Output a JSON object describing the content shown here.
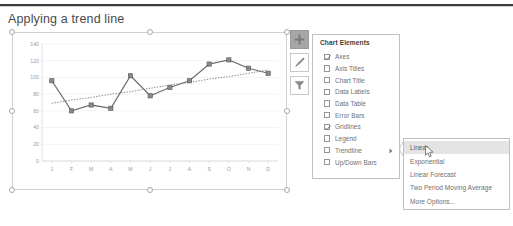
{
  "page": {
    "title": "Applying a trend line"
  },
  "chart_buttons": [
    {
      "name": "chart-elements-button",
      "icon": "plus-icon",
      "label": "Chart Elements",
      "active": true
    },
    {
      "name": "chart-styles-button",
      "icon": "brush-icon",
      "label": "Chart Styles",
      "active": false
    },
    {
      "name": "chart-filters-button",
      "icon": "funnel-icon",
      "label": "Chart Filters",
      "active": false
    }
  ],
  "chart_elements_panel": {
    "title": "Chart Elements",
    "items": [
      {
        "label": "Axes",
        "checked": true,
        "has_submenu": false
      },
      {
        "label": "Axis Titles",
        "checked": false,
        "has_submenu": false
      },
      {
        "label": "Chart Title",
        "checked": false,
        "has_submenu": false
      },
      {
        "label": "Data Labels",
        "checked": false,
        "has_submenu": false
      },
      {
        "label": "Data Table",
        "checked": false,
        "has_submenu": false
      },
      {
        "label": "Error Bars",
        "checked": false,
        "has_submenu": false
      },
      {
        "label": "Gridlines",
        "checked": true,
        "has_submenu": false
      },
      {
        "label": "Legend",
        "checked": false,
        "has_submenu": false
      },
      {
        "label": "Trendline",
        "checked": false,
        "has_submenu": true
      },
      {
        "label": "Up/Down Bars",
        "checked": false,
        "has_submenu": false
      }
    ]
  },
  "trendline_submenu": {
    "items": [
      {
        "label": "Linear",
        "highlighted": true
      },
      {
        "label": "Exponential",
        "highlighted": false
      },
      {
        "label": "Linear Forecast",
        "highlighted": false
      },
      {
        "label": "Two Period Moving Average",
        "highlighted": false
      },
      {
        "label": "More Options...",
        "highlighted": false
      }
    ]
  },
  "colors": {
    "rule": "#3d3d3d",
    "series": "#6f6f6f",
    "marker": "#8a8a8a",
    "trend": "#7a7a7a",
    "grid": "#ededed",
    "panel_border": "#c0c0c0",
    "highlight": "#e4e4e4",
    "active_button": "#a6a6a6",
    "tick_text": "#9b9b9b"
  },
  "chart_data": {
    "type": "line",
    "title": "",
    "xlabel": "",
    "ylabel": "",
    "grid": true,
    "legend": "none",
    "ylim": [
      0,
      140
    ],
    "yticks": [
      0,
      20,
      40,
      60,
      80,
      100,
      120,
      140
    ],
    "categories": [
      "J",
      "F",
      "M",
      "A",
      "M",
      "J",
      "J",
      "A",
      "S",
      "O",
      "N",
      "D"
    ],
    "series": [
      {
        "name": "Series 1",
        "type": "line",
        "markers": true,
        "values": [
          96,
          60,
          67,
          63,
          102,
          78,
          88,
          96,
          116,
          121,
          111,
          105
        ]
      },
      {
        "name": "Linear Trendline",
        "type": "trendline",
        "style": "dotted",
        "values": [
          69,
          73,
          76,
          80,
          83,
          87,
          91,
          94,
          98,
          101,
          105,
          109
        ]
      }
    ]
  }
}
